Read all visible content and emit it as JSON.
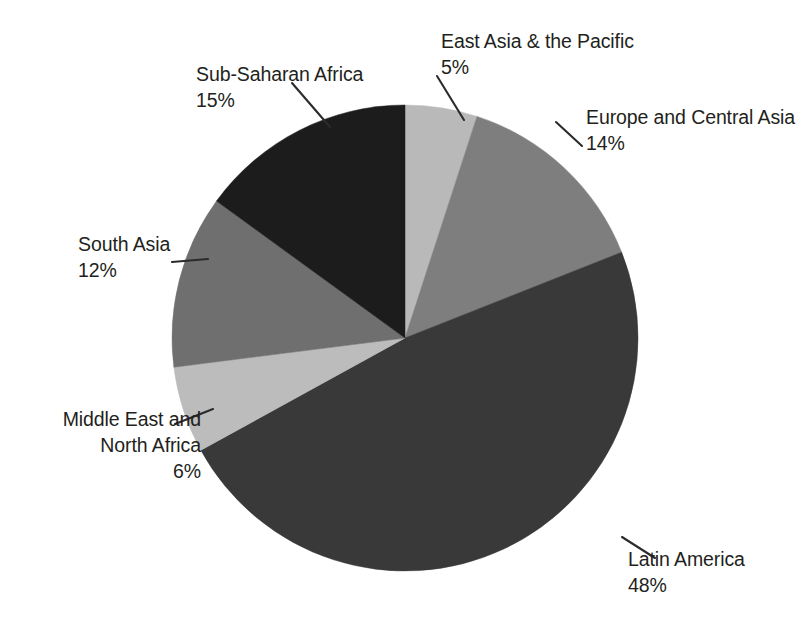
{
  "chart_data": {
    "type": "pie",
    "title": "",
    "subtitle": "",
    "xlabel": "",
    "ylabel": "",
    "grid": false,
    "legend_position": "none",
    "label_style": "callout-with-leader-lines",
    "units": "percent",
    "total": 100,
    "start_angle_deg": 0,
    "direction": "clockwise",
    "center": {
      "x": 405,
      "y": 338
    },
    "radius": 233,
    "categories": [
      "East Asia & the Pacific",
      "Europe and Central Asia",
      "Latin America",
      "Middle East and North Africa",
      "South Asia",
      "Sub-Saharan Africa"
    ],
    "values": [
      5,
      14,
      48,
      6,
      12,
      15
    ],
    "slices": [
      {
        "name": "East Asia & the Pacific",
        "label": "East Asia & the Pacific",
        "value": 5,
        "value_text": "5%",
        "color": "#b9b9b9",
        "start_angle_deg": 0,
        "end_angle_deg": 18
      },
      {
        "name": "Europe and Central Asia",
        "label": "Europe and Central Asia",
        "value": 14,
        "value_text": "14%",
        "color": "#7e7e7e",
        "start_angle_deg": 18,
        "end_angle_deg": 68.4
      },
      {
        "name": "Latin America",
        "label": "Latin America",
        "value": 48,
        "value_text": "48%",
        "color": "#393939",
        "start_angle_deg": 68.4,
        "end_angle_deg": 241.2
      },
      {
        "name": "Middle East and North Africa",
        "label": "Middle East and North Africa",
        "value": 6,
        "value_text": "6%",
        "color": "#bcbcbc",
        "start_angle_deg": 241.2,
        "end_angle_deg": 262.8
      },
      {
        "name": "South Asia",
        "label": "South Asia",
        "value": 12,
        "value_text": "12%",
        "color": "#6f6f6f",
        "start_angle_deg": 262.8,
        "end_angle_deg": 306
      },
      {
        "name": "Sub-Saharan Africa",
        "label": "Sub-Saharan Africa",
        "value": 15,
        "value_text": "15%",
        "color": "#1c1c1c",
        "start_angle_deg": 306,
        "end_angle_deg": 360
      }
    ]
  },
  "labels": {
    "east_asia": {
      "name": "East Asia & the Pacific",
      "percent": "5%"
    },
    "europe": {
      "name": "Europe and Central Asia",
      "percent": "14%"
    },
    "latin_america": {
      "name": "Latin America",
      "percent": "48%"
    },
    "mena": {
      "name_line1": "Middle East and",
      "name_line2": "North Africa",
      "percent": "6%"
    },
    "south_asia": {
      "name": "South Asia",
      "percent": "12%"
    },
    "sub_saharan": {
      "name": "Sub-Saharan Africa",
      "percent": "15%"
    }
  },
  "style": {
    "background": "#ffffff",
    "text_color": "#231f20",
    "leader_line_color": "#2b2b2b"
  }
}
